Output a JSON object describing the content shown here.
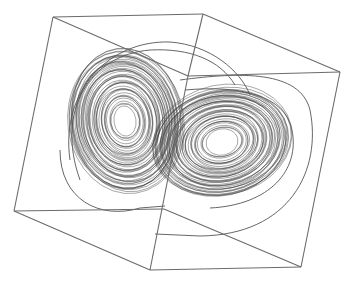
{
  "figure": {
    "background": "#ffffff",
    "line_color": "#6b6b6b",
    "trajectory_color": "#3a3a3a"
  },
  "cube": {
    "vertices": {
      "top_back_left": [
        53,
        17
      ],
      "top_back_right": [
        203,
        14
      ],
      "top_right": [
        340,
        72
      ],
      "top_front": [
        188,
        76
      ],
      "bottom_left": [
        14,
        211
      ],
      "bottom_mid": [
        164,
        209
      ],
      "bottom_front": [
        150,
        270
      ],
      "bottom_right": [
        301,
        267
      ]
    },
    "edges": [
      [
        "top_back_left",
        "top_back_right"
      ],
      [
        "top_back_right",
        "top_right"
      ],
      [
        "top_back_left",
        "top_front"
      ],
      [
        "top_back_right",
        "top_front"
      ],
      [
        "top_front",
        "top_right"
      ],
      [
        "top_back_left",
        "bottom_left"
      ],
      [
        "bottom_left",
        "bottom_mid"
      ],
      [
        "bottom_left",
        "bottom_front"
      ],
      [
        "top_front",
        "bottom_front"
      ],
      [
        "bottom_mid",
        "bottom_right"
      ],
      [
        "bottom_front",
        "bottom_right"
      ],
      [
        "top_right",
        "bottom_right"
      ]
    ]
  },
  "attractor": {
    "lobes": [
      {
        "name": "left-lobe",
        "cx": 125,
        "cy": 121,
        "rx_inner": 11,
        "ry_inner": 14,
        "rx_outer": 57,
        "ry_outer": 72,
        "tilt": -8,
        "turns": 46
      },
      {
        "name": "right-lobe",
        "cx": 222,
        "cy": 142,
        "rx_inner": 16,
        "ry_inner": 12,
        "rx_outer": 70,
        "ry_outer": 54,
        "tilt": -12,
        "turns": 44
      }
    ],
    "outer_loops": [
      "M 70 160 C 60 90, 110 40, 170 42 C 210 45, 240 70, 250 95",
      "M 80 180 C 55 110, 90 55, 150 50 C 190 48, 220 60, 235 85",
      "M 180 80 C 240 72, 300 70, 310 110 C 322 170, 290 235, 200 236 L 155 234",
      "M 60 150 C 60 200, 100 220, 140 208 L 165 206",
      "M 185 90 C 240 85, 285 95, 292 130 C 300 170, 270 205, 210 208"
    ]
  }
}
